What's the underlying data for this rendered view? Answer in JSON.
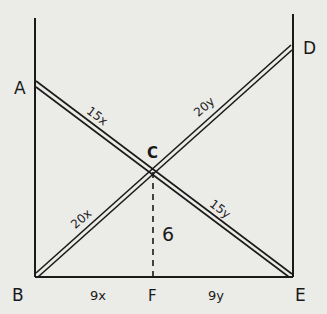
{
  "diagram": {
    "type": "geometry",
    "points": {
      "A": {
        "label": "A"
      },
      "B": {
        "label": "B"
      },
      "C": {
        "label": "C"
      },
      "D": {
        "label": "D"
      },
      "E": {
        "label": "E"
      },
      "F": {
        "label": "F"
      }
    },
    "segment_labels": {
      "AC": "15x",
      "CD": "20y",
      "BC": "20x",
      "CE": "15y",
      "CF": "6",
      "BF": "9x",
      "FE": "9y"
    },
    "colors": {
      "ink": "#1a1a1a",
      "paper": "#ebebe8"
    }
  }
}
